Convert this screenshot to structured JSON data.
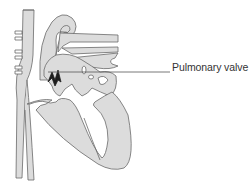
{
  "diagram": {
    "labels": [
      {
        "text": "Pulmonary valve",
        "points_to": "pulmonary-valve"
      }
    ]
  },
  "colors": {
    "fill": "#dcdcdc",
    "outline": "#6a6a6a",
    "valve": "#1e1e1e",
    "leader_line": "#555555",
    "label": "#333333"
  }
}
